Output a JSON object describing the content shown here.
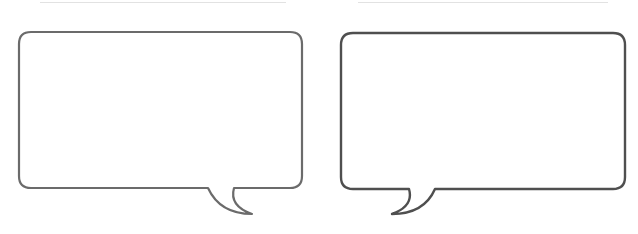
{
  "bubbles": [
    {
      "id": "left",
      "tail_direction": "right",
      "stroke_color": "#6b6b6b",
      "text": ""
    },
    {
      "id": "right",
      "tail_direction": "left",
      "stroke_color": "#4f4f4f",
      "text": ""
    }
  ],
  "colors": {
    "background": "#ffffff",
    "top_rule": "#e2e2e2"
  }
}
